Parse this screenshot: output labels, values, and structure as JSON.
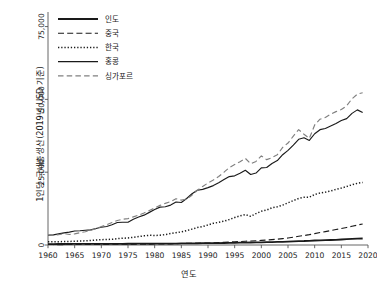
{
  "chart_data": {
    "type": "line",
    "title": "",
    "xlabel": "연도",
    "ylabel": "1인당 국내총생산(2019년 USD 기준)",
    "xlim": [
      1960,
      2020
    ],
    "ylim": [
      0,
      80000
    ],
    "xticks": [
      1960,
      1965,
      1970,
      1975,
      1980,
      1985,
      1990,
      1995,
      2000,
      2005,
      2010,
      2015,
      2020
    ],
    "xtick_labels": [
      "1960",
      "1965",
      "1970",
      "1975",
      "1980",
      "1985",
      "1990",
      "1995",
      "2000",
      "2005",
      "2010",
      "2015",
      "2020"
    ],
    "yticks": [
      0,
      25000,
      50000,
      75000
    ],
    "ytick_labels": [
      "0",
      "25,000",
      "50,000",
      "75,000"
    ],
    "grid": false,
    "legend_position": "upper-left",
    "x": [
      1960,
      1961,
      1962,
      1963,
      1964,
      1965,
      1966,
      1967,
      1968,
      1969,
      1970,
      1971,
      1972,
      1973,
      1974,
      1975,
      1976,
      1977,
      1978,
      1979,
      1980,
      1981,
      1982,
      1983,
      1984,
      1985,
      1986,
      1987,
      1988,
      1989,
      1990,
      1991,
      1992,
      1993,
      1994,
      1995,
      1996,
      1997,
      1998,
      1999,
      2000,
      2001,
      2002,
      2003,
      2004,
      2005,
      2006,
      2007,
      2008,
      2009,
      2010,
      2011,
      2012,
      2013,
      2014,
      2015,
      2016,
      2017,
      2018,
      2019
    ],
    "series": [
      {
        "name": "인도",
        "style": "solid-thick",
        "color": "#1a1a1a",
        "values": [
          330,
          330,
          335,
          350,
          370,
          355,
          355,
          370,
          380,
          400,
          415,
          410,
          400,
          410,
          415,
          430,
          425,
          450,
          465,
          430,
          440,
          465,
          470,
          490,
          505,
          525,
          540,
          555,
          590,
          620,
          645,
          640,
          660,
          680,
          710,
          750,
          790,
          820,
          855,
          895,
          930,
          955,
          990,
          1040,
          1105,
          1175,
          1255,
          1340,
          1370,
          1450,
          1545,
          1620,
          1660,
          1710,
          1790,
          1890,
          1990,
          2090,
          2170,
          2230
        ]
      },
      {
        "name": "중국",
        "style": "dashed",
        "color": "#1a1a1a",
        "values": [
          195,
          155,
          145,
          155,
          180,
          200,
          215,
          200,
          190,
          205,
          225,
          235,
          240,
          250,
          250,
          265,
          260,
          275,
          295,
          315,
          335,
          345,
          370,
          400,
          450,
          505,
          540,
          590,
          645,
          655,
          670,
          725,
          815,
          905,
          1005,
          1100,
          1190,
          1290,
          1370,
          1460,
          1570,
          1690,
          1830,
          2000,
          2190,
          2410,
          2680,
          3000,
          3250,
          3550,
          3900,
          4270,
          4600,
          4950,
          5310,
          5660,
          6030,
          6440,
          6840,
          7210
        ]
      },
      {
        "name": "한국",
        "style": "dotted",
        "color": "#1a1a1a",
        "values": [
          1100,
          1110,
          1120,
          1180,
          1230,
          1280,
          1370,
          1430,
          1560,
          1700,
          1820,
          1900,
          1960,
          2180,
          2320,
          2420,
          2650,
          2880,
          3140,
          3340,
          3250,
          3380,
          3560,
          3930,
          4220,
          4490,
          4930,
          5450,
          6000,
          6350,
          6880,
          7440,
          7780,
          8170,
          8740,
          9430,
          10000,
          10450,
          9830,
          10790,
          11590,
          12010,
          12800,
          13130,
          13700,
          14500,
          15230,
          16000,
          16380,
          16410,
          17350,
          17850,
          18150,
          18550,
          19100,
          19550,
          20080,
          20690,
          21180,
          21470
        ]
      },
      {
        "name": "홍콩",
        "style": "solid-thin",
        "color": "#1a1a1a",
        "values": [
          3350,
          3480,
          3820,
          4160,
          4440,
          4800,
          4890,
          5050,
          5200,
          5650,
          6100,
          6370,
          6940,
          7710,
          7830,
          7800,
          8850,
          9600,
          10250,
          11200,
          12200,
          13000,
          13150,
          13700,
          14750,
          14600,
          15950,
          17600,
          18800,
          19100,
          19700,
          20400,
          21350,
          22450,
          23500,
          23750,
          24600,
          25650,
          24200,
          24700,
          26500,
          26600,
          28000,
          29000,
          31000,
          32500,
          34300,
          36300,
          36800,
          35900,
          38200,
          39600,
          40000,
          40850,
          41750,
          42750,
          43400,
          45200,
          46400,
          45500
        ]
      },
      {
        "name": "싱가포르",
        "style": "long-dash",
        "color": "#808080",
        "values": [
          3500,
          3380,
          3530,
          3920,
          3590,
          3820,
          4220,
          4560,
          5060,
          5620,
          6300,
          6930,
          7740,
          8430,
          8860,
          9070,
          9650,
          10250,
          11000,
          11850,
          12700,
          13600,
          14300,
          14900,
          15900,
          15400,
          15800,
          17100,
          18800,
          20100,
          21300,
          22300,
          23500,
          25000,
          26600,
          27600,
          28600,
          29750,
          27900,
          28700,
          30600,
          29300,
          30000,
          31000,
          33500,
          35000,
          37400,
          39600,
          38000,
          36600,
          41200,
          43200,
          43800,
          44900,
          45800,
          46500,
          47800,
          50200,
          51800,
          52300
        ]
      }
    ]
  },
  "legend": {
    "items": [
      {
        "label": "인도"
      },
      {
        "label": "중국"
      },
      {
        "label": "한국"
      },
      {
        "label": "홍콩"
      },
      {
        "label": "싱가포르"
      }
    ]
  }
}
